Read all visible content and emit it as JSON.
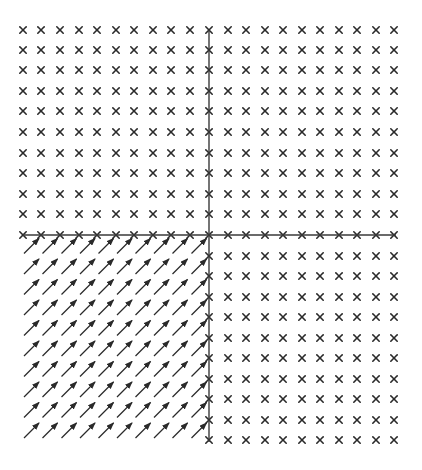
{
  "diagram": {
    "type": "vector-field",
    "colors": {
      "background": "#ffffff",
      "ink": "#2a2a2a",
      "axis": "#3a3a3a"
    },
    "axes": {
      "vertical": {
        "x": 209,
        "y1": 30,
        "y2": 442
      },
      "horizontal": {
        "y": 235,
        "x1": 23,
        "x2": 396
      }
    },
    "grid": {
      "columns_left": [
        23,
        41,
        60,
        79,
        97,
        116,
        134,
        153,
        171,
        190
      ],
      "column_axis": 209,
      "columns_right": [
        228,
        246,
        265,
        283,
        302,
        320,
        339,
        357,
        376,
        394
      ],
      "rows_top": [
        30,
        50,
        70,
        91,
        111,
        132,
        153,
        173,
        194,
        214
      ],
      "row_axis": 235,
      "rows_bottom": [
        256,
        276,
        297,
        317,
        338,
        358,
        379,
        399,
        420,
        440
      ]
    },
    "quadrants": {
      "upper_left": {
        "marker": "cross-icon",
        "symbol": "×"
      },
      "upper_right": {
        "marker": "cross-icon",
        "symbol": "×"
      },
      "lower_right": {
        "marker": "cross-icon",
        "symbol": "×"
      },
      "lower_left": {
        "marker": "arrow-icon",
        "direction": "northeast",
        "dx": 14,
        "dy": -14
      }
    },
    "marker_size": 3.2
  }
}
